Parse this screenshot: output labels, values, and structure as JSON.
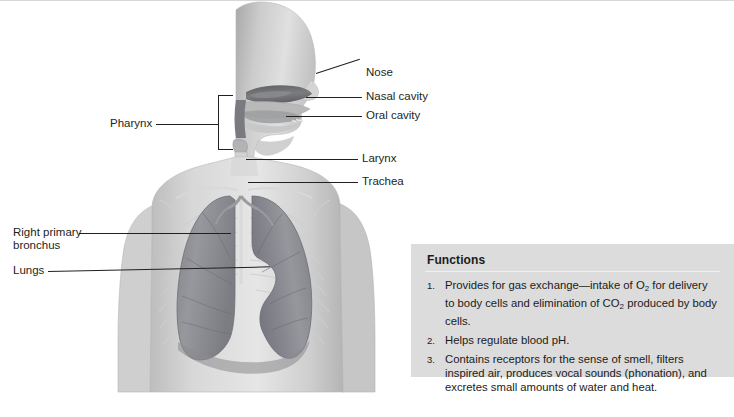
{
  "figure": {
    "labels": {
      "nose": "Nose",
      "nasal_cavity": "Nasal cavity",
      "oral_cavity": "Oral cavity",
      "pharynx": "Pharynx",
      "larynx": "Larynx",
      "trachea": "Trachea",
      "right_primary_bronchus_line1": "Right primary",
      "right_primary_bronchus_line2": "bronchus",
      "lungs": "Lungs"
    },
    "colors": {
      "leader_line": "#231f20",
      "label_text": "#231f20",
      "body_light": "#e3e3e3",
      "body_mid": "#c9c9c9",
      "body_shade": "#b0b0b0",
      "lung_fill": "#8f9094",
      "lung_fill_dark": "#77787c",
      "airway_dark": "#6e6f73",
      "skeleton": "#d6d6d6"
    }
  },
  "functions_panel": {
    "title": "Functions",
    "background": "#dcdcdc",
    "items": [
      {
        "number": "1.",
        "text_parts": [
          {
            "t": "Provides for gas exchange—intake of O"
          },
          {
            "sub": "2"
          },
          {
            "t": " for delivery to body cells and elimination of CO"
          },
          {
            "sub": "2"
          },
          {
            "t": " produced by body cells."
          }
        ],
        "plain": "Provides for gas exchange—intake of O2 for delivery to body cells and elimination of CO2 produced by body cells."
      },
      {
        "number": "2.",
        "text_parts": [
          {
            "t": "Helps regulate blood pH."
          }
        ],
        "plain": "Helps regulate blood pH."
      },
      {
        "number": "3.",
        "text_parts": [
          {
            "t": "Contains receptors for the sense of smell, filters inspired air, produces vocal sounds (phonation), and excretes small amounts of water and heat."
          }
        ],
        "plain": "Contains receptors for the sense of smell, filters inspired air, produces vocal sounds (phonation), and excretes small amounts of water and heat."
      }
    ]
  }
}
